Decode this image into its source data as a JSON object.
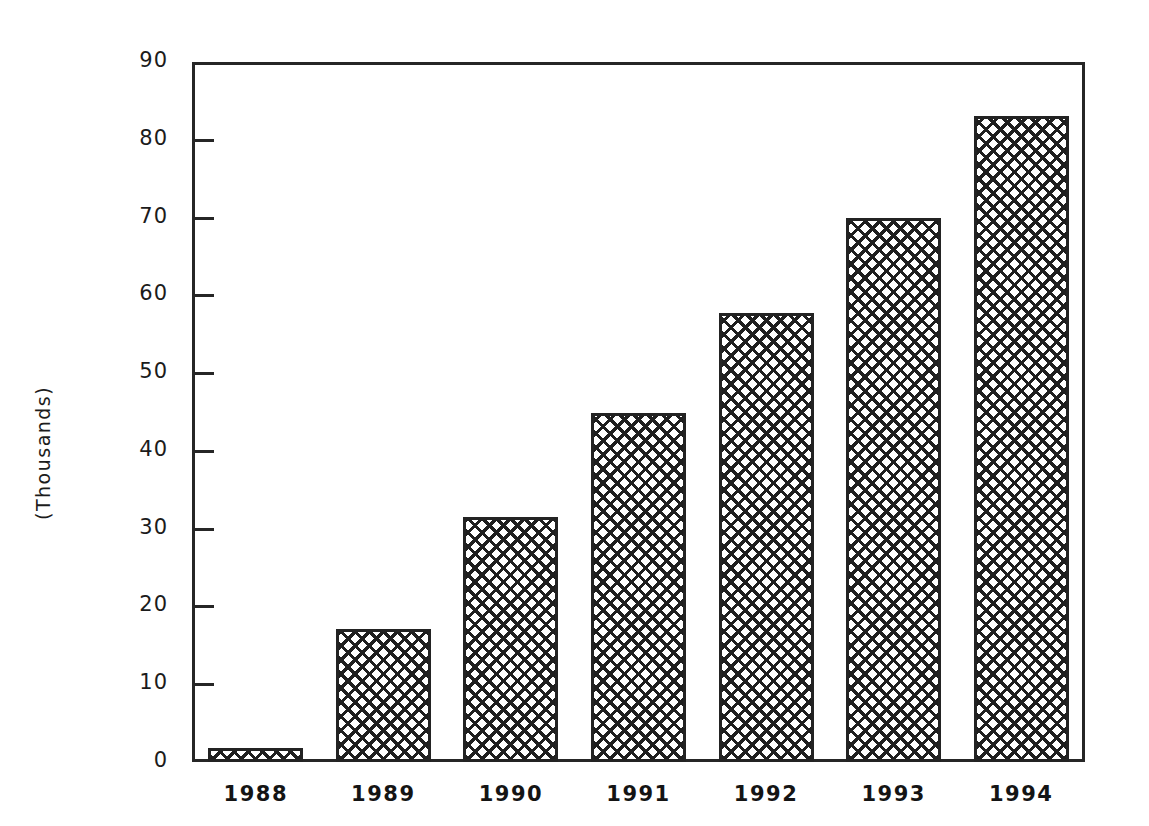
{
  "chart_data": {
    "type": "bar",
    "title": "",
    "xlabel": "",
    "ylabel": "(Thousands)",
    "categories": [
      "1988",
      "1989",
      "1990",
      "1991",
      "1992",
      "1993",
      "1994"
    ],
    "values": [
      1.8,
      17.1,
      31.5,
      44.9,
      57.7,
      70.0,
      83.0
    ],
    "ylim": [
      0,
      90
    ],
    "ytick_labels": [
      "0",
      "10",
      "20",
      "30",
      "40",
      "50",
      "60",
      "70",
      "80",
      "90"
    ],
    "ytick_values": [
      0,
      10,
      20,
      30,
      40,
      50,
      60,
      70,
      80,
      90
    ],
    "grid": false,
    "legend": null,
    "bar_fill": "crosshatch",
    "colors": {
      "axis": "#262626",
      "bar_outline": "#232323",
      "bar_hatch": "#1f1f1f",
      "background": "#ffffff",
      "text": "#1b1b1b"
    }
  }
}
